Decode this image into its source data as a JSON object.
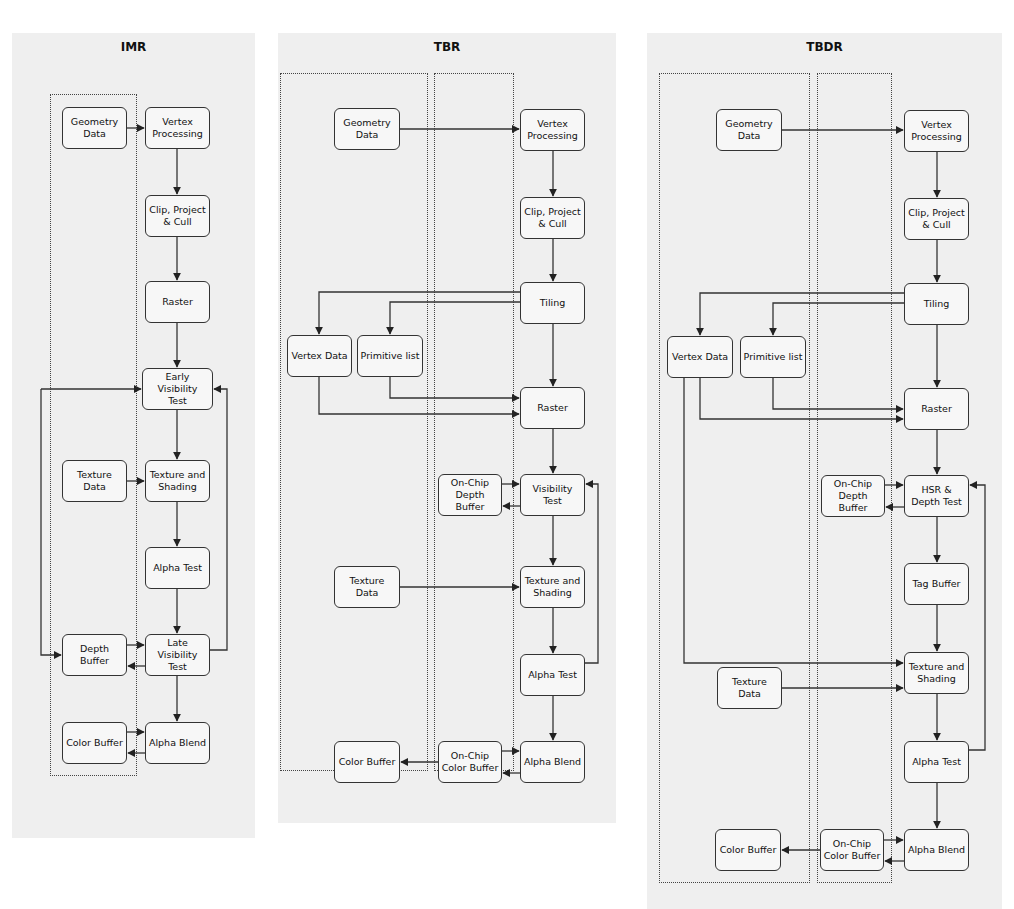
{
  "panels": [
    {
      "id": "imr",
      "title": "IMR",
      "nodes": {
        "geometry_data": "Geometry\nData",
        "vertex_processing": "Vertex\nProcessing",
        "clip_project_cull": "Clip, Project\n& Cull",
        "raster": "Raster",
        "early_visibility_test": "Early Visibility\nTest",
        "texture_data": "Texture Data",
        "texture_and_shading": "Texture and\nShading",
        "alpha_test": "Alpha Test",
        "depth_buffer": "Depth Buffer",
        "late_visibility_test": "Late Visibility\nTest",
        "color_buffer": "Color Buffer",
        "alpha_blend": "Alpha Blend"
      }
    },
    {
      "id": "tbr",
      "title": "TBR",
      "nodes": {
        "geometry_data": "Geometry\nData",
        "vertex_processing": "Vertex\nProcessing",
        "clip_project_cull": "Clip, Project\n& Cull",
        "tiling": "Tiling",
        "vertex_data": "Vertex Data",
        "primitive_list": "Primitive list",
        "raster": "Raster",
        "on_chip_depth_buffer": "On-Chip\nDepth Buffer",
        "visibility_test": "Visibility Test",
        "texture_data": "Texture Data",
        "texture_and_shading": "Texture and\nShading",
        "alpha_test": "Alpha Test",
        "color_buffer": "Color Buffer",
        "on_chip_color_buffer": "On-Chip\nColor Buffer",
        "alpha_blend": "Alpha Blend"
      }
    },
    {
      "id": "tbdr",
      "title": "TBDR",
      "nodes": {
        "geometry_data": "Geometry\nData",
        "vertex_processing": "Vertex\nProcessing",
        "clip_project_cull": "Clip, Project\n& Cull",
        "tiling": "Tiling",
        "vertex_data": "Vertex Data",
        "primitive_list": "Primitive list",
        "raster": "Raster",
        "on_chip_depth_buffer": "On-Chip\nDepth Buffer",
        "hsr_depth_test": "HSR &\nDepth Test",
        "tag_buffer": "Tag Buffer",
        "texture_data": "Texture Data",
        "texture_and_shading": "Texture and\nShading",
        "alpha_test": "Alpha Test",
        "color_buffer": "Color Buffer",
        "on_chip_color_buffer": "On-Chip\nColor Buffer",
        "alpha_blend": "Alpha Blend"
      }
    }
  ],
  "colors": {
    "panel_bg": "#efefef",
    "line": "#333333",
    "node_bg": "#f7f7f7"
  }
}
